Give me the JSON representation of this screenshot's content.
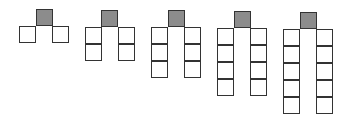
{
  "diagram": {
    "type": "pattern-sequence",
    "colors": {
      "shaded_fill": "#8c8c8c",
      "square_fill": "#ffffff",
      "stroke": "#333333",
      "background": "#ffffff"
    },
    "square_size_px": 17,
    "figures": [
      {
        "index": 1,
        "shaded_x": 36,
        "shaded_y": 9,
        "column_height": 1,
        "left_x": 19,
        "right_x": 52
      },
      {
        "index": 2,
        "shaded_x": 101,
        "shaded_y": 10,
        "column_height": 2,
        "left_x": 85,
        "right_x": 118
      },
      {
        "index": 3,
        "shaded_x": 168,
        "shaded_y": 10,
        "column_height": 3,
        "left_x": 151,
        "right_x": 184
      },
      {
        "index": 4,
        "shaded_x": 234,
        "shaded_y": 11,
        "column_height": 4,
        "left_x": 217,
        "right_x": 250
      },
      {
        "index": 5,
        "shaded_x": 300,
        "shaded_y": 12,
        "column_height": 5,
        "left_x": 283,
        "right_x": 316
      }
    ]
  }
}
